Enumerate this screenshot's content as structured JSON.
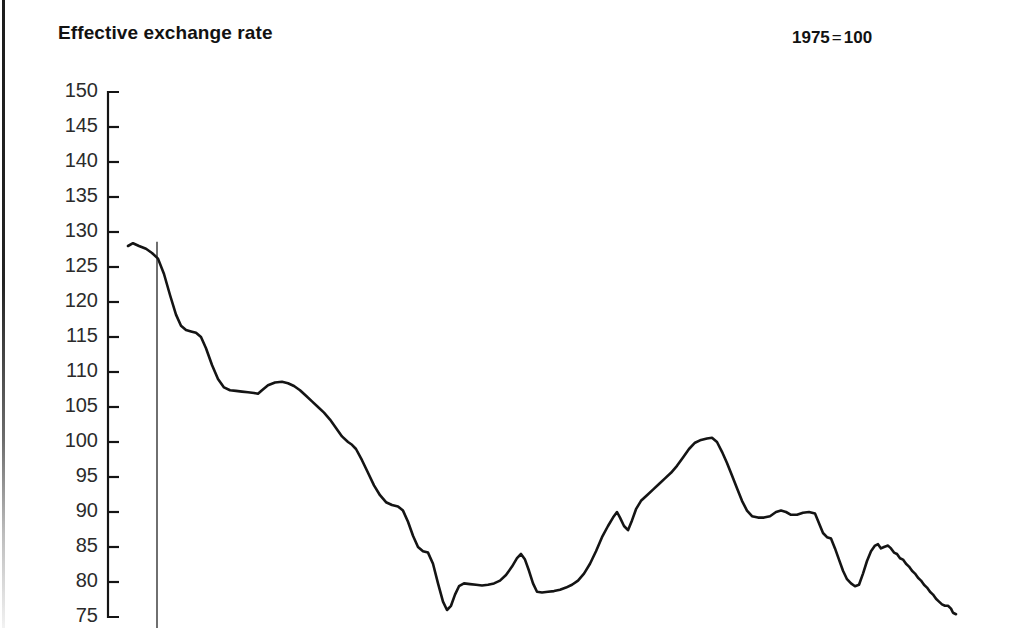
{
  "header": {
    "title": "Effective exchange rate",
    "index_note_base": "1975",
    "index_note_eq": "=",
    "index_note_value": "100"
  },
  "chart_data": {
    "type": "line",
    "title": "Effective exchange rate",
    "subtitle": "1975 = 100",
    "xlabel": "",
    "ylabel": "",
    "ylim": [
      75,
      150
    ],
    "ytick_step": 5,
    "ytick_labels": [
      "150",
      "145",
      "140",
      "135",
      "130",
      "125",
      "120",
      "115",
      "110",
      "105",
      "100",
      "95",
      "90",
      "85",
      "80",
      "75"
    ],
    "ytick_values": [
      150,
      145,
      140,
      135,
      130,
      125,
      120,
      115,
      110,
      105,
      100,
      95,
      90,
      85,
      80,
      75
    ],
    "grid": false,
    "legend": "none",
    "axis_tick_direction": "inward",
    "line_color": "#141414",
    "line_width": 2.6,
    "annotations": [
      {
        "type": "vertical-line",
        "name": "reference-marker",
        "x_px": 157,
        "y_top_value": 128.6,
        "y_bottom_value": 75,
        "color": "#333333",
        "width": 1.4
      }
    ],
    "series": [
      {
        "name": "Effective exchange rate",
        "points": [
          [
            128,
            128.0
          ],
          [
            133,
            128.4
          ],
          [
            139,
            128.0
          ],
          [
            146,
            127.6
          ],
          [
            152,
            127.0
          ],
          [
            158,
            126.2
          ],
          [
            164,
            124.0
          ],
          [
            170,
            121.0
          ],
          [
            176,
            118.2
          ],
          [
            181,
            116.6
          ],
          [
            186,
            116.0
          ],
          [
            191,
            115.8
          ],
          [
            196,
            115.6
          ],
          [
            201,
            115.0
          ],
          [
            206,
            113.4
          ],
          [
            212,
            111.0
          ],
          [
            218,
            109.0
          ],
          [
            224,
            107.8
          ],
          [
            230,
            107.4
          ],
          [
            236,
            107.3
          ],
          [
            242,
            107.2
          ],
          [
            248,
            107.1
          ],
          [
            254,
            107.0
          ],
          [
            258,
            106.9
          ],
          [
            262,
            107.4
          ],
          [
            268,
            108.1
          ],
          [
            275,
            108.5
          ],
          [
            282,
            108.6
          ],
          [
            288,
            108.4
          ],
          [
            294,
            108.0
          ],
          [
            300,
            107.4
          ],
          [
            306,
            106.6
          ],
          [
            312,
            105.8
          ],
          [
            318,
            105.0
          ],
          [
            324,
            104.2
          ],
          [
            330,
            103.2
          ],
          [
            336,
            102.0
          ],
          [
            342,
            100.8
          ],
          [
            348,
            100.0
          ],
          [
            352,
            99.6
          ],
          [
            356,
            99.0
          ],
          [
            362,
            97.4
          ],
          [
            368,
            95.6
          ],
          [
            374,
            93.8
          ],
          [
            380,
            92.4
          ],
          [
            386,
            91.4
          ],
          [
            392,
            91.0
          ],
          [
            398,
            90.8
          ],
          [
            403,
            90.2
          ],
          [
            408,
            88.6
          ],
          [
            413,
            86.6
          ],
          [
            418,
            85.0
          ],
          [
            423,
            84.4
          ],
          [
            428,
            84.2
          ],
          [
            433,
            82.6
          ],
          [
            438,
            79.8
          ],
          [
            443,
            77.2
          ],
          [
            447,
            76.0
          ],
          [
            451,
            76.6
          ],
          [
            455,
            78.2
          ],
          [
            459,
            79.4
          ],
          [
            464,
            79.8
          ],
          [
            470,
            79.7
          ],
          [
            476,
            79.6
          ],
          [
            482,
            79.5
          ],
          [
            488,
            79.6
          ],
          [
            494,
            79.8
          ],
          [
            500,
            80.2
          ],
          [
            506,
            81.0
          ],
          [
            512,
            82.2
          ],
          [
            517,
            83.4
          ],
          [
            521,
            84.0
          ],
          [
            525,
            83.2
          ],
          [
            529,
            81.6
          ],
          [
            533,
            79.8
          ],
          [
            537,
            78.6
          ],
          [
            542,
            78.5
          ],
          [
            548,
            78.6
          ],
          [
            554,
            78.7
          ],
          [
            560,
            78.9
          ],
          [
            566,
            79.2
          ],
          [
            572,
            79.6
          ],
          [
            578,
            80.2
          ],
          [
            584,
            81.2
          ],
          [
            590,
            82.6
          ],
          [
            596,
            84.4
          ],
          [
            602,
            86.4
          ],
          [
            608,
            88.0
          ],
          [
            613,
            89.2
          ],
          [
            617,
            90.0
          ],
          [
            620,
            89.2
          ],
          [
            624,
            88.0
          ],
          [
            628,
            87.4
          ],
          [
            632,
            88.8
          ],
          [
            636,
            90.4
          ],
          [
            641,
            91.6
          ],
          [
            647,
            92.4
          ],
          [
            653,
            93.2
          ],
          [
            659,
            94.0
          ],
          [
            665,
            94.8
          ],
          [
            671,
            95.6
          ],
          [
            677,
            96.6
          ],
          [
            683,
            97.8
          ],
          [
            689,
            99.0
          ],
          [
            695,
            99.9
          ],
          [
            701,
            100.3
          ],
          [
            707,
            100.5
          ],
          [
            712,
            100.6
          ],
          [
            717,
            100.0
          ],
          [
            722,
            98.6
          ],
          [
            727,
            97.0
          ],
          [
            732,
            95.2
          ],
          [
            737,
            93.4
          ],
          [
            742,
            91.6
          ],
          [
            747,
            90.2
          ],
          [
            752,
            89.4
          ],
          [
            758,
            89.2
          ],
          [
            764,
            89.2
          ],
          [
            770,
            89.4
          ],
          [
            776,
            90.0
          ],
          [
            781,
            90.2
          ],
          [
            786,
            90.0
          ],
          [
            791,
            89.6
          ],
          [
            797,
            89.6
          ],
          [
            803,
            89.9
          ],
          [
            809,
            90.0
          ],
          [
            815,
            89.8
          ],
          [
            819,
            88.4
          ],
          [
            823,
            87.0
          ],
          [
            827,
            86.4
          ],
          [
            831,
            86.2
          ],
          [
            835,
            84.8
          ],
          [
            839,
            83.2
          ],
          [
            843,
            81.6
          ],
          [
            847,
            80.4
          ],
          [
            851,
            79.8
          ],
          [
            855,
            79.4
          ],
          [
            859,
            79.6
          ],
          [
            863,
            81.2
          ],
          [
            867,
            83.0
          ],
          [
            871,
            84.4
          ],
          [
            875,
            85.2
          ],
          [
            878,
            85.4
          ],
          [
            881,
            84.8
          ],
          [
            884,
            85.0
          ],
          [
            888,
            85.2
          ],
          [
            891,
            84.8
          ],
          [
            894,
            84.2
          ],
          [
            897,
            84.0
          ],
          [
            900,
            83.4
          ],
          [
            903,
            83.2
          ],
          [
            906,
            82.6
          ],
          [
            909,
            82.2
          ],
          [
            912,
            81.6
          ],
          [
            915,
            81.2
          ],
          [
            918,
            80.6
          ],
          [
            921,
            80.2
          ],
          [
            924,
            79.6
          ],
          [
            927,
            79.2
          ],
          [
            930,
            78.6
          ],
          [
            933,
            78.2
          ],
          [
            936,
            77.6
          ],
          [
            939,
            77.2
          ],
          [
            942,
            76.8
          ],
          [
            945,
            76.6
          ],
          [
            948,
            76.6
          ],
          [
            951,
            76.2
          ],
          [
            953,
            75.6
          ],
          [
            956,
            75.4
          ]
        ]
      }
    ]
  }
}
